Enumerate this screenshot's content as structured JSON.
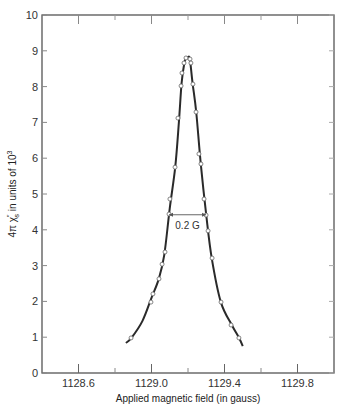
{
  "chart_data": {
    "type": "line",
    "title": "",
    "xlabel": "Applied magnetic field (in gauss)",
    "ylabel": "4π χ″ in units of 10³",
    "ylabel_parts": {
      "prefix": "4π χ",
      "sup": "″",
      "sub": "s",
      "suffix": " in units of 10",
      "exp": "3"
    },
    "xlim": [
      1128.4,
      1130.0
    ],
    "ylim": [
      0,
      10
    ],
    "x_ticks_major": [
      1128.6,
      1129.0,
      1129.4,
      1129.8
    ],
    "x_tick_labels": [
      "1128.6",
      "1129.0",
      "1129.4",
      "1129.8"
    ],
    "x_ticks_minor": [
      1128.8,
      1129.2,
      1129.6
    ],
    "y_ticks": [
      0,
      1,
      2,
      3,
      4,
      5,
      6,
      7,
      8,
      9,
      10
    ],
    "y_tick_labels": [
      "0",
      "1",
      "2",
      "3",
      "4",
      "5",
      "6",
      "7",
      "8",
      "9",
      "10"
    ],
    "grid": false,
    "series": [
      {
        "name": "fitted curve",
        "style": "solid",
        "color": "#2a2a2a",
        "x": [
          1128.86,
          1128.89,
          1128.95,
          1129.0,
          1129.04,
          1129.07,
          1129.1,
          1129.13,
          1129.15,
          1129.165,
          1129.18,
          1129.19,
          1129.2,
          1129.21,
          1129.225,
          1129.245,
          1129.27,
          1129.3,
          1129.33,
          1129.38,
          1129.44,
          1129.48,
          1129.5
        ],
        "y": [
          0.84,
          0.98,
          1.45,
          2.1,
          2.63,
          3.3,
          4.6,
          5.75,
          7.0,
          8.1,
          8.66,
          8.8,
          8.82,
          8.77,
          8.1,
          7.29,
          5.84,
          4.41,
          3.21,
          1.98,
          1.34,
          0.98,
          0.75
        ]
      },
      {
        "name": "measured points",
        "style": "markers",
        "marker": "open-circle",
        "x": [
          1128.888,
          1128.997,
          1129.008,
          1129.041,
          1129.058,
          1129.074,
          1129.096,
          1129.101,
          1129.129,
          1129.145,
          1129.162,
          1129.167,
          1129.178,
          1129.189,
          1129.211,
          1129.216,
          1129.227,
          1129.244,
          1129.26,
          1129.271,
          1129.288,
          1129.299,
          1129.31,
          1129.332,
          1129.381,
          1129.436,
          1129.479
        ],
        "y": [
          0.98,
          1.98,
          2.21,
          2.63,
          3.04,
          3.38,
          4.44,
          4.86,
          5.75,
          7.12,
          8.02,
          8.38,
          8.66,
          8.8,
          8.77,
          8.66,
          8.07,
          7.29,
          6.12,
          5.84,
          4.86,
          4.41,
          3.97,
          3.21,
          1.98,
          1.34,
          0.98
        ]
      }
    ],
    "annotations": [
      {
        "type": "width-arrow",
        "x_start": 1129.096,
        "x_end": 1129.299,
        "y": 4.42,
        "label": "0.2 G"
      }
    ]
  }
}
